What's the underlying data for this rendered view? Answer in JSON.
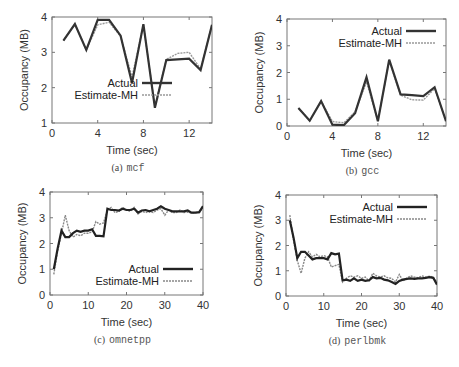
{
  "chart_data": [
    {
      "id": "a",
      "type": "line",
      "caption_prefix": "(a)",
      "caption_name": "mcf",
      "xlabel": "Time (sec)",
      "ylabel": "Occupancy (MB)",
      "xlim": [
        0,
        14
      ],
      "ylim": [
        1,
        4
      ],
      "xticks": [
        0,
        4,
        8,
        12
      ],
      "yticks": [
        1,
        2,
        3,
        4
      ],
      "legend_position": "lower-center",
      "frame": {
        "left": 52,
        "top": 17,
        "right": 212,
        "bottom": 123
      },
      "series": [
        {
          "name": "Actual",
          "style": "solid",
          "color": "#333333",
          "x": [
            1,
            2,
            3,
            4,
            5,
            6,
            7,
            8,
            9,
            10,
            11,
            12,
            13,
            14
          ],
          "y": [
            3.33,
            3.8,
            3.07,
            3.92,
            3.92,
            3.47,
            2.13,
            3.8,
            1.43,
            2.78,
            2.8,
            2.82,
            2.5,
            3.78
          ]
        },
        {
          "name": "Estimate-MH",
          "style": "dashed",
          "color": "#999999",
          "x": [
            1,
            2,
            3,
            4,
            5,
            6,
            7,
            8,
            9,
            10,
            11,
            12,
            13,
            14
          ],
          "y": [
            3.33,
            3.8,
            3.07,
            3.78,
            3.85,
            3.45,
            2.3,
            3.78,
            1.47,
            2.8,
            2.97,
            3.0,
            2.53,
            3.78
          ]
        }
      ]
    },
    {
      "id": "b",
      "type": "line",
      "caption_prefix": "(b)",
      "caption_name": "gcc",
      "xlabel": "Time (sec)",
      "ylabel": "Occupancy (MB)",
      "xlim": [
        0,
        14
      ],
      "ylim": [
        0,
        4
      ],
      "xticks": [
        0,
        4,
        8,
        12
      ],
      "yticks": [
        0,
        1,
        2,
        3,
        4
      ],
      "legend_position": "upper-right",
      "frame": {
        "left": 287,
        "top": 19,
        "right": 446,
        "bottom": 126
      },
      "series": [
        {
          "name": "Actual",
          "style": "solid",
          "color": "#333333",
          "x": [
            1,
            2,
            3,
            4,
            5,
            6,
            7,
            8,
            9,
            10,
            11,
            12,
            13,
            14
          ],
          "y": [
            0.67,
            0.2,
            0.93,
            0.05,
            0.03,
            0.48,
            1.82,
            0.18,
            2.48,
            1.18,
            1.15,
            1.12,
            1.45,
            0.18
          ]
        },
        {
          "name": "Estimate-MH",
          "style": "dashed",
          "color": "#999999",
          "x": [
            1,
            2,
            3,
            4,
            5,
            6,
            7,
            8,
            9,
            10,
            11,
            12,
            13,
            14
          ],
          "y": [
            0.67,
            0.2,
            0.93,
            0.17,
            0.12,
            0.53,
            1.65,
            0.2,
            2.45,
            1.15,
            0.98,
            0.97,
            1.4,
            0.18
          ]
        }
      ]
    },
    {
      "id": "c",
      "type": "line",
      "caption_prefix": "(c)",
      "caption_name": "omnetpp",
      "xlabel": "Time (sec)",
      "ylabel": "Occupancy (MB)",
      "xlim": [
        0,
        40
      ],
      "ylim": [
        0,
        4
      ],
      "xticks": [
        0,
        10,
        20,
        30,
        40
      ],
      "yticks": [
        0,
        1,
        2,
        3,
        4
      ],
      "legend_position": "lower-right",
      "frame": {
        "left": 50,
        "top": 192,
        "right": 203,
        "bottom": 295
      },
      "series": [
        {
          "name": "Actual",
          "style": "solid",
          "color": "#222222",
          "x": [
            1,
            2,
            3,
            4,
            5,
            6,
            7,
            8,
            9,
            10,
            11,
            12,
            13,
            14,
            15,
            16,
            17,
            18,
            19,
            20,
            21,
            22,
            23,
            24,
            25,
            26,
            27,
            28,
            29,
            30,
            31,
            32,
            33,
            34,
            35,
            36,
            37,
            38,
            39,
            40
          ],
          "y": [
            1.0,
            1.8,
            2.5,
            2.25,
            2.25,
            2.4,
            2.5,
            2.45,
            2.5,
            2.5,
            2.55,
            2.3,
            2.3,
            2.28,
            3.35,
            3.3,
            3.3,
            3.28,
            3.35,
            3.3,
            3.3,
            3.35,
            3.2,
            3.28,
            3.3,
            3.25,
            3.3,
            3.35,
            3.45,
            3.35,
            3.3,
            3.25,
            3.25,
            3.25,
            3.25,
            3.28,
            3.2,
            3.2,
            3.22,
            3.45
          ]
        },
        {
          "name": "Estimate-MH",
          "style": "dashed",
          "color": "#888888",
          "x": [
            1,
            2,
            3,
            4,
            5,
            6,
            7,
            8,
            9,
            10,
            11,
            12,
            13,
            14,
            15,
            16,
            17,
            18,
            19,
            20,
            21,
            22,
            23,
            24,
            25,
            26,
            27,
            28,
            29,
            30,
            31,
            32,
            33,
            34,
            35,
            36,
            37,
            38,
            39,
            40
          ],
          "y": [
            0.8,
            1.7,
            2.4,
            3.1,
            2.5,
            2.25,
            2.35,
            2.3,
            2.4,
            2.4,
            2.45,
            2.85,
            2.75,
            2.8,
            3.3,
            3.4,
            3.2,
            3.25,
            3.4,
            3.3,
            3.25,
            3.4,
            3.15,
            3.25,
            3.2,
            3.25,
            3.2,
            3.3,
            3.35,
            3.1,
            3.3,
            3.2,
            3.2,
            3.3,
            3.2,
            3.22,
            3.18,
            3.2,
            3.2,
            3.4
          ]
        }
      ]
    },
    {
      "id": "d",
      "type": "line",
      "caption_prefix": "(d)",
      "caption_name": "perlbmk",
      "xlabel": "Time (sec)",
      "ylabel": "Occupancy (MB)",
      "xlim": [
        0,
        40
      ],
      "ylim": [
        0,
        4
      ],
      "xticks": [
        0,
        10,
        20,
        30,
        40
      ],
      "yticks": [
        0,
        1,
        2,
        3,
        4
      ],
      "legend_position": "upper-right",
      "frame": {
        "left": 286,
        "top": 195,
        "right": 437,
        "bottom": 296
      },
      "series": [
        {
          "name": "Actual",
          "style": "solid",
          "color": "#222222",
          "x": [
            1,
            2,
            3,
            4,
            5,
            6,
            7,
            8,
            9,
            10,
            11,
            12,
            13,
            14,
            15,
            16,
            17,
            18,
            19,
            20,
            21,
            22,
            23,
            24,
            25,
            26,
            27,
            28,
            29,
            30,
            31,
            32,
            33,
            34,
            35,
            36,
            37,
            38,
            39,
            40
          ],
          "y": [
            3.0,
            2.3,
            1.5,
            1.75,
            1.75,
            1.6,
            1.45,
            1.5,
            1.5,
            1.5,
            1.45,
            1.7,
            1.65,
            1.68,
            0.62,
            0.65,
            0.6,
            0.7,
            0.6,
            0.65,
            0.6,
            0.62,
            0.75,
            0.7,
            0.72,
            0.65,
            0.62,
            0.55,
            0.48,
            0.6,
            0.65,
            0.68,
            0.7,
            0.68,
            0.7,
            0.7,
            0.72,
            0.75,
            0.72,
            0.45
          ]
        },
        {
          "name": "Estimate-MH",
          "style": "dashed",
          "color": "#888888",
          "x": [
            1,
            2,
            3,
            4,
            5,
            6,
            7,
            8,
            9,
            10,
            11,
            12,
            13,
            14,
            15,
            16,
            17,
            18,
            19,
            20,
            21,
            22,
            23,
            24,
            25,
            26,
            27,
            28,
            29,
            30,
            31,
            32,
            33,
            34,
            35,
            36,
            37,
            38,
            39,
            40
          ],
          "y": [
            3.2,
            2.2,
            1.4,
            0.9,
            1.5,
            1.75,
            1.55,
            1.65,
            1.55,
            1.6,
            1.55,
            1.15,
            1.2,
            1.25,
            0.55,
            0.7,
            0.8,
            0.75,
            0.8,
            0.7,
            0.75,
            0.6,
            0.9,
            0.8,
            0.75,
            0.8,
            0.72,
            0.7,
            0.55,
            0.85,
            0.6,
            0.7,
            0.8,
            0.75,
            0.72,
            0.8,
            0.75,
            0.78,
            0.75,
            0.55
          ]
        }
      ]
    }
  ]
}
